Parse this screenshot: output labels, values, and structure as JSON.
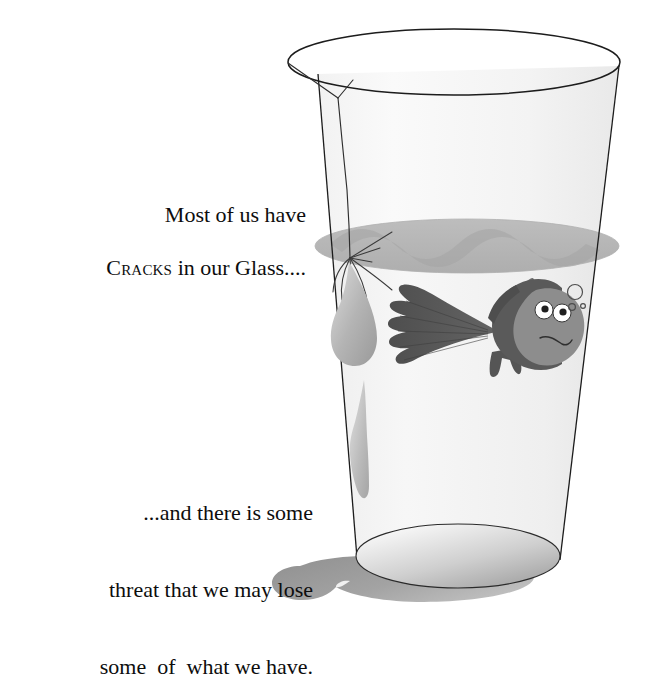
{
  "image": {
    "kind": "illustration-with-caption",
    "background_color": "#ffffff",
    "width": 656,
    "height": 636
  },
  "captions": {
    "top": {
      "line1": "Most of us have",
      "line2_smallcaps": "Cracks",
      "line2_rest": " in our Glass...."
    },
    "bottom": {
      "line1": "...and there is some",
      "line2": "threat that we may lose",
      "line3": "some  of  what we have."
    },
    "text_color": "#0d0d0d",
    "font_size_px": 22
  },
  "illustration": {
    "name": "cracked-drinking-glass-with-fish",
    "glass": {
      "outline_color": "#1a1a1a",
      "body_fill": "#f4f4f4",
      "rim_label": "glass-rim-ellipse",
      "base_label": "glass-base-ellipse"
    },
    "water": {
      "surface_color": "#b9b9b9",
      "surface_wave_color": "#a6a6a6",
      "body_color": "#efefef",
      "label": "water-surface"
    },
    "crack": {
      "color": "#333333",
      "label": "crack-line",
      "fork_label": "crack-fork-at-rim",
      "web_label": "crack-web-junction"
    },
    "leaks": [
      {
        "label": "leak-droplet-large",
        "color": "#b5b5b5"
      },
      {
        "label": "leak-streak-small",
        "color": "#c0c0c0"
      }
    ],
    "fish": {
      "label": "goldfish",
      "body_color": "#5a5a5a",
      "head_color": "#8a8a8a",
      "eye_white": "#ffffff",
      "pupil_color": "#1f1f1f",
      "mouth_color": "#2a2a2a",
      "expression": "frowning"
    },
    "bubbles": {
      "label": "air-bubbles",
      "stroke_color": "#555555",
      "count": 3
    },
    "shadow": {
      "label": "spilled-puddle-shadow",
      "color": "#9a9a9a"
    }
  }
}
